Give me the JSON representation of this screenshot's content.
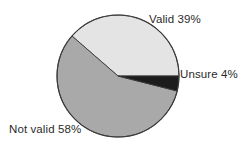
{
  "chart_data": {
    "type": "pie",
    "title": "",
    "subtitle": "",
    "xlabel": "",
    "ylabel": "",
    "legend_position": "none",
    "grid": false,
    "labels_inline": true,
    "start_angle_deg": 0,
    "direction": "counterclockwise",
    "categories": [
      "Valid",
      "Not valid",
      "Unsure"
    ],
    "values": [
      39,
      58,
      4
    ],
    "units": "%",
    "slices": [
      {
        "name": "Valid",
        "value": 39,
        "label": "Valid 39%",
        "color": "#e4e4e4",
        "percent_text": "39%"
      },
      {
        "name": "Not valid",
        "value": 58,
        "label": "Not valid 58%",
        "color": "#a9a9a9",
        "percent_text": "58%"
      },
      {
        "name": "Unsure",
        "value": 4,
        "label": "Unsure 4%",
        "color": "#1c1c1c",
        "percent_text": "4%"
      }
    ],
    "annotations": []
  },
  "style": {
    "background": "#ffffff",
    "outline_color": "#3a3a3a",
    "text_color": "#2b2b2b"
  }
}
